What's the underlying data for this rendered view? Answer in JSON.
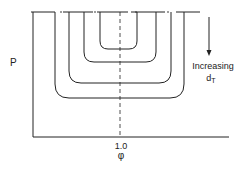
{
  "diagram": {
    "y_axis_label": "P",
    "x_axis_label": "φ",
    "x_tick_label": "1.0",
    "annotation": {
      "line1": "Increasing",
      "line2_main": "d",
      "line2_sub": "T"
    },
    "curves": [
      {
        "name": "curve-1",
        "left_x": 100,
        "right_x": 137,
        "bottom_y": 49
      },
      {
        "name": "curve-2",
        "left_x": 84,
        "right_x": 156,
        "bottom_y": 62
      },
      {
        "name": "curve-3",
        "left_x": 69,
        "right_x": 171,
        "bottom_y": 83
      },
      {
        "name": "curve-4",
        "left_x": 55,
        "right_x": 184,
        "bottom_y": 98
      }
    ],
    "colors": {
      "line": "#222222",
      "background": "#ffffff"
    }
  }
}
